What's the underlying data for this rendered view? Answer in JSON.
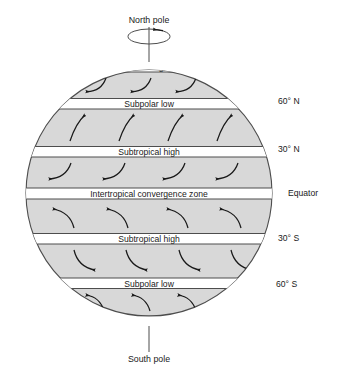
{
  "figure": {
    "title_north": "North pole",
    "title_south": "South pole",
    "rotation_icon": "rotation-arrow-icon"
  },
  "colors": {
    "globe_fill": "#d8d8d8",
    "band_fill": "#ffffff",
    "stroke": "#4d4d4d",
    "text": "#1a1a1a"
  },
  "geometry": {
    "cx": 149,
    "cy": 193,
    "r": 123
  },
  "pressure_bands": [
    {
      "id": "polar-high-north",
      "label": "Polar high",
      "y": 62.5,
      "height": 9.5
    },
    {
      "id": "subpolar-low-north",
      "label": "Subpolar low",
      "y": 98.5,
      "height": 10.5
    },
    {
      "id": "subtropical-high-north",
      "label": "Subtropical high",
      "y": 146.5,
      "height": 10.5
    },
    {
      "id": "itcz",
      "label": "Intertropical convergence zone",
      "y": 188.0,
      "height": 11.0
    },
    {
      "id": "subtropical-high-south",
      "label": "Subtropical high",
      "y": 233.5,
      "height": 10.5
    },
    {
      "id": "subpolar-low-south",
      "label": "Subpolar low",
      "y": 278.0,
      "height": 10.5
    },
    {
      "id": "polar-high-south",
      "label": "Polar high",
      "y": 316.0,
      "height": 10.0
    }
  ],
  "latitude_labels": [
    {
      "id": "lat-60-n",
      "label": "60° N",
      "x": 278,
      "y": 104
    },
    {
      "id": "lat-30-n",
      "label": "30° N",
      "x": 278,
      "y": 152
    },
    {
      "id": "lat-equator",
      "label": "Equator",
      "x": 288,
      "y": 196
    },
    {
      "id": "lat-30-s",
      "label": "30° S",
      "x": 278,
      "y": 241
    },
    {
      "id": "lat-60-s",
      "label": "60° S",
      "x": 276,
      "y": 287
    }
  ],
  "wind_belts": [
    {
      "id": "polar-easterlies-north",
      "direction": "down-left",
      "count": 3
    },
    {
      "id": "westerlies-north",
      "direction": "up-right",
      "count": 4
    },
    {
      "id": "trades-northeast",
      "direction": "down-left",
      "count": 4
    },
    {
      "id": "trades-southeast",
      "direction": "up-left",
      "count": 4
    },
    {
      "id": "westerlies-south",
      "direction": "down-right",
      "count": 4
    },
    {
      "id": "polar-easterlies-south",
      "direction": "up-left",
      "count": 3
    }
  ]
}
